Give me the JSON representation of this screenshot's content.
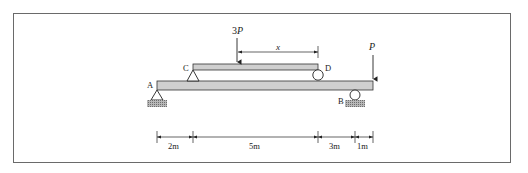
{
  "diagram": {
    "type": "structural beam diagram",
    "loads": {
      "upper_load": "3P",
      "end_load": "P",
      "distance_label": "x"
    },
    "points": {
      "A": "A",
      "B": "B",
      "C": "C",
      "D": "D"
    },
    "dimensions": [
      "2m",
      "5m",
      "3m",
      "1m"
    ],
    "colors": {
      "beam_fill": "#cfcfcf",
      "line": "#222222",
      "ground_hatch": "#9a9a9a",
      "frame": "#6a6a6a"
    }
  }
}
